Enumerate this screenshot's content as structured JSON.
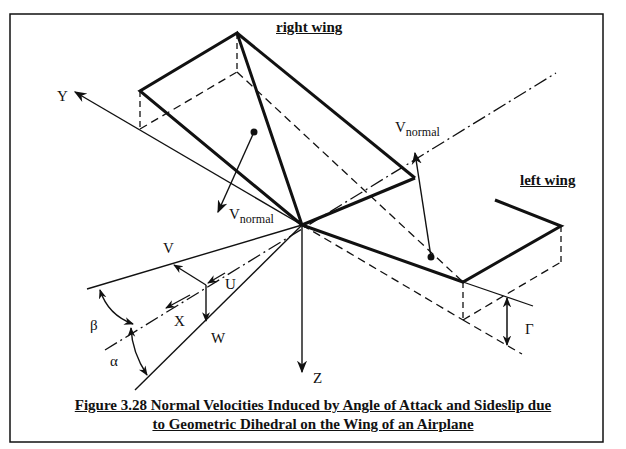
{
  "figure": {
    "caption_line1": "Figure 3.28 Normal Velocities Induced by Angle of Attack and Sideslip due",
    "caption_line2": "to Geometric Dihedral on the Wing of an Airplane",
    "labels": {
      "right_wing": "right wing",
      "left_wing": "left wing",
      "y_axis": "Y",
      "x_axis": "X",
      "z_axis": "Z",
      "v": "V",
      "u": "U",
      "w": "W",
      "beta": "β",
      "alpha": "α",
      "gamma": "Γ",
      "v_normal_main": "V",
      "v_normal_sub": "normal"
    },
    "colors": {
      "line": "#111111",
      "background": "#ffffff"
    }
  }
}
